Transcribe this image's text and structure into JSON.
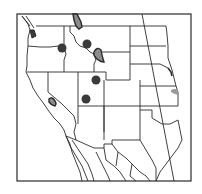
{
  "map": {
    "title": "",
    "region": "Western United States and northern Mexico",
    "style": {
      "background": "#ffffff",
      "line_color": "#2a2a2a",
      "marker_color": "#3a3a3a",
      "range_fill": "#8c8c8c",
      "faint_fill": "#9a9a9a"
    },
    "markers": [
      {
        "id": "dot-oregon-idaho",
        "type": "dot",
        "x": 62,
        "y": 48,
        "r": 4.5
      },
      {
        "id": "dot-central-idaho",
        "type": "dot",
        "x": 87,
        "y": 44,
        "r": 4.5
      },
      {
        "id": "dot-northern-utah",
        "type": "dot",
        "x": 96,
        "y": 80,
        "r": 4.5
      },
      {
        "id": "dot-central-utah",
        "type": "dot",
        "x": 86,
        "y": 99,
        "r": 4.5
      }
    ],
    "ranges": [
      {
        "id": "range-northwest-montana",
        "type": "outlined-region"
      },
      {
        "id": "range-southwest-montana",
        "type": "outlined-region"
      },
      {
        "id": "range-puget-sound",
        "type": "outlined-region"
      },
      {
        "id": "range-california-sierra",
        "type": "outlined-region"
      },
      {
        "id": "range-iowa-nebraska",
        "type": "faint-region"
      }
    ]
  }
}
